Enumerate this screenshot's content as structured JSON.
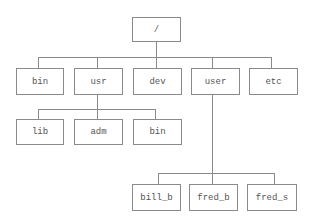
{
  "diagram": {
    "type": "tree",
    "title": "",
    "colors": {
      "line": "#8a8a8a",
      "text": "#555555",
      "background": "#ffffff"
    },
    "root": {
      "label": "/",
      "children": [
        {
          "label": "bin"
        },
        {
          "label": "usr",
          "children": [
            {
              "label": "lib"
            },
            {
              "label": "adm"
            },
            {
              "label": "bin"
            }
          ]
        },
        {
          "label": "dev"
        },
        {
          "label": "user",
          "children": [
            {
              "label": "bill_b"
            },
            {
              "label": "fred_b"
            },
            {
              "label": "fred_s"
            }
          ]
        },
        {
          "label": "etc"
        }
      ]
    },
    "nodes": {
      "root": "/",
      "bin": "bin",
      "usr": "usr",
      "dev": "dev",
      "user": "user",
      "etc": "etc",
      "lib": "lib",
      "adm": "adm",
      "usr_bin": "bin",
      "bill_b": "bill_b",
      "fred_b": "fred_b",
      "fred_s": "fred_s"
    }
  }
}
